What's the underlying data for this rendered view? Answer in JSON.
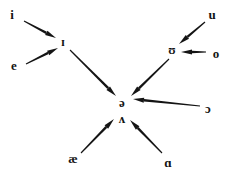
{
  "figure": {
    "type": "vowel-reduction-diagram",
    "width": 234,
    "height": 176,
    "background_color": "#ffffff",
    "ink_color": "#141414"
  },
  "nodes": [
    {
      "id": "i",
      "label": "i",
      "x": 12,
      "y": 14,
      "size": 13
    },
    {
      "id": "small-cap-i",
      "label": "ɪ",
      "x": 63,
      "y": 42,
      "size": 12
    },
    {
      "id": "e",
      "label": "e",
      "x": 14,
      "y": 65,
      "size": 13
    },
    {
      "id": "u",
      "label": "u",
      "x": 212,
      "y": 14,
      "size": 13
    },
    {
      "id": "small-cap-u",
      "label": "ʊ",
      "x": 172,
      "y": 50,
      "size": 12
    },
    {
      "id": "o",
      "label": "o",
      "x": 216,
      "y": 53,
      "size": 13
    },
    {
      "id": "schwa",
      "label": "ə",
      "x": 122,
      "y": 102,
      "size": 13
    },
    {
      "id": "wedge",
      "label": "ʌ",
      "x": 122,
      "y": 118,
      "size": 13
    },
    {
      "id": "open-o",
      "label": "ɔ",
      "x": 208,
      "y": 108,
      "size": 13
    },
    {
      "id": "ash",
      "label": "æ",
      "x": 73,
      "y": 158,
      "size": 13
    },
    {
      "id": "script-a",
      "label": "ɑ",
      "x": 168,
      "y": 162,
      "size": 13
    }
  ],
  "arrows": [
    {
      "id": "i-to-small-cap-i",
      "from": "i",
      "to": "small-cap-i",
      "x1": 24,
      "y1": 21,
      "x2": 56,
      "y2": 38
    },
    {
      "id": "e-to-small-cap-i",
      "from": "e",
      "to": "small-cap-i",
      "x1": 26,
      "y1": 64,
      "x2": 58,
      "y2": 48
    },
    {
      "id": "small-cap-i-to-schwa",
      "from": "small-cap-i",
      "to": "schwa",
      "x1": 70,
      "y1": 50,
      "x2": 116,
      "y2": 96
    },
    {
      "id": "u-to-small-cap-u",
      "from": "u",
      "to": "small-cap-u",
      "x1": 205,
      "y1": 22,
      "x2": 179,
      "y2": 44
    },
    {
      "id": "o-to-small-cap-u",
      "from": "o",
      "to": "small-cap-u",
      "x1": 206,
      "y1": 52,
      "x2": 181,
      "y2": 52
    },
    {
      "id": "small-cap-u-to-schwa",
      "from": "small-cap-u",
      "to": "schwa",
      "x1": 169,
      "y1": 59,
      "x2": 131,
      "y2": 96
    },
    {
      "id": "open-o-to-schwa",
      "from": "open-o",
      "to": "schwa",
      "x1": 200,
      "y1": 106,
      "x2": 133,
      "y2": 99
    },
    {
      "id": "ash-to-wedge",
      "from": "ash",
      "to": "wedge",
      "x1": 81,
      "y1": 153,
      "x2": 114,
      "y2": 119
    },
    {
      "id": "script-a-to-wedge",
      "from": "script-a",
      "to": "wedge",
      "x1": 162,
      "y1": 153,
      "x2": 130,
      "y2": 120
    }
  ]
}
